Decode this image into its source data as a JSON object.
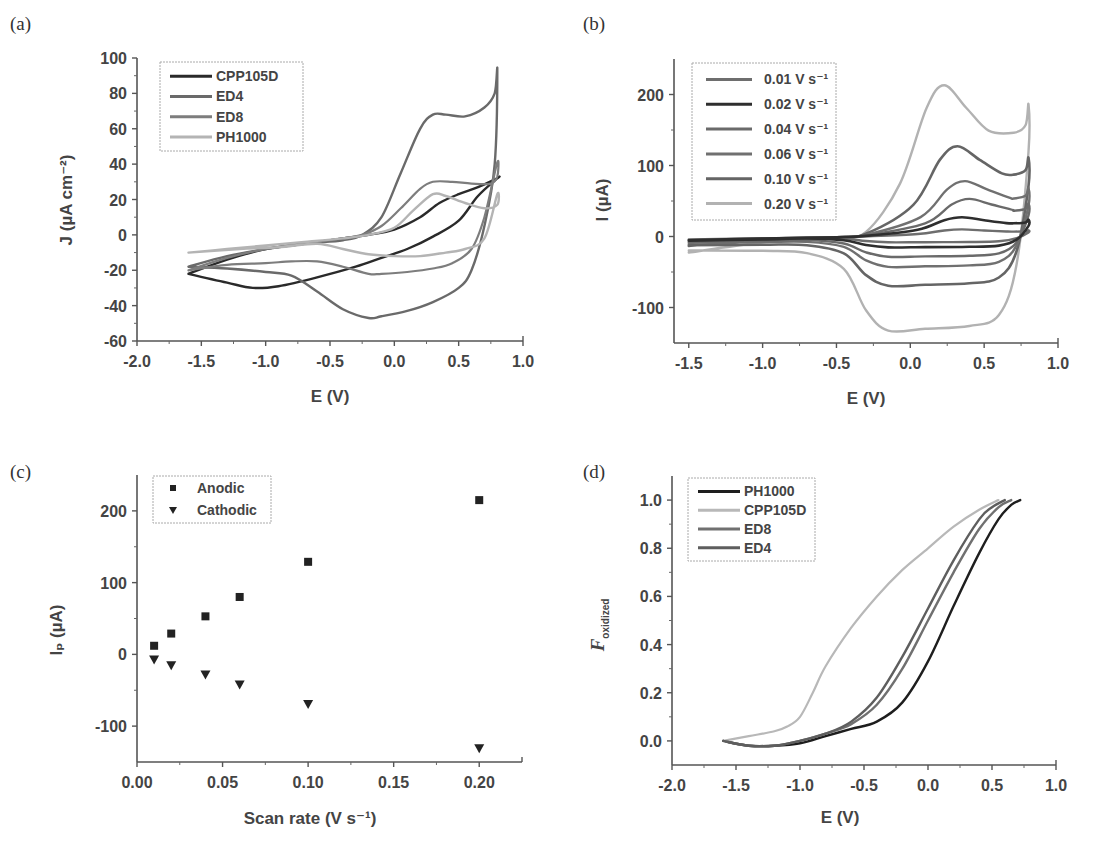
{
  "chart_data": [
    {
      "id": "a",
      "panel_label": "(a)",
      "type": "line",
      "title": "",
      "xlabel": "E (V)",
      "ylabel": "J (µA cm⁻²)",
      "xlim": [
        -2.0,
        1.0
      ],
      "ylim": [
        -60,
        100
      ],
      "xticks": [
        -2.0,
        -1.5,
        -1.0,
        -0.5,
        0.0,
        0.5,
        1.0
      ],
      "xtick_labels": [
        "-2.0",
        "-1.5",
        "-1.0",
        "-0.5",
        "0.0",
        "0.5",
        "1.0"
      ],
      "yticks": [
        -60,
        -40,
        -20,
        0,
        20,
        40,
        60,
        80,
        100
      ],
      "ytick_labels": [
        "-60",
        "-40",
        "-20",
        "0",
        "20",
        "40",
        "60",
        "80",
        "100"
      ],
      "grid": false,
      "legend_position": "upper-left",
      "series": [
        {
          "name": "CPP105D",
          "color": "#2a2a2a",
          "width": 2.4,
          "x": [
            -1.6,
            -1.3,
            -1.0,
            -0.7,
            -0.4,
            -0.2,
            0.0,
            0.2,
            0.35,
            0.5,
            0.65,
            0.8,
            0.8,
            0.65,
            0.5,
            0.3,
            0.1,
            -0.1,
            -0.3,
            -0.6,
            -0.9,
            -1.1,
            -1.3,
            -1.6
          ],
          "y": [
            -22,
            -14,
            -8,
            -5,
            -2,
            0,
            3,
            10,
            18,
            23,
            27,
            32,
            32,
            22,
            8,
            -1,
            -8,
            -13,
            -18,
            -24,
            -29,
            -30,
            -27,
            -22
          ]
        },
        {
          "name": "ED4",
          "color": "#6a6a6a",
          "width": 2.4,
          "x": [
            -1.6,
            -1.3,
            -1.0,
            -0.7,
            -0.4,
            -0.25,
            -0.1,
            0.05,
            0.2,
            0.3,
            0.4,
            0.55,
            0.7,
            0.78,
            0.8,
            0.78,
            0.7,
            0.6,
            0.5,
            0.3,
            0.1,
            -0.1,
            -0.2,
            -0.4,
            -0.6,
            -0.8,
            -1.0,
            -1.3,
            -1.6
          ],
          "y": [
            -18,
            -12,
            -8,
            -5,
            -3,
            0,
            10,
            35,
            60,
            68,
            68,
            67,
            72,
            80,
            93,
            40,
            5,
            -20,
            -30,
            -38,
            -43,
            -46,
            -47,
            -42,
            -32,
            -23,
            -21,
            -19,
            -18
          ]
        },
        {
          "name": "ED8",
          "color": "#7d7d7d",
          "width": 2.2,
          "x": [
            -1.6,
            -1.3,
            -1.0,
            -0.7,
            -0.4,
            -0.25,
            -0.1,
            0.05,
            0.2,
            0.3,
            0.45,
            0.6,
            0.75,
            0.8,
            0.8,
            0.7,
            0.6,
            0.45,
            0.3,
            0.1,
            -0.1,
            -0.2,
            -0.4,
            -0.6,
            -0.8,
            -1.0,
            -1.3,
            -1.6
          ],
          "y": [
            -20,
            -13,
            -8,
            -5,
            -2,
            0,
            5,
            15,
            26,
            30,
            30,
            29,
            29,
            33,
            41,
            10,
            -8,
            -16,
            -19,
            -21,
            -22,
            -22,
            -18,
            -15,
            -15,
            -16,
            -17,
            -20
          ]
        },
        {
          "name": "PH1000",
          "color": "#b4b4b4",
          "width": 2.4,
          "x": [
            -1.6,
            -1.3,
            -1.0,
            -0.7,
            -0.4,
            -0.2,
            0.0,
            0.15,
            0.3,
            0.4,
            0.55,
            0.7,
            0.8,
            0.8,
            0.7,
            0.55,
            0.4,
            0.2,
            0.0,
            -0.2,
            -0.4,
            -0.6,
            -0.9,
            -1.2,
            -1.6
          ],
          "y": [
            -10,
            -8,
            -6,
            -4,
            -2,
            0,
            4,
            14,
            23,
            22,
            18,
            15,
            17,
            23,
            -2,
            -8,
            -10,
            -12,
            -12,
            -11,
            -8,
            -5,
            -7,
            -8,
            -10
          ]
        }
      ]
    },
    {
      "id": "b",
      "panel_label": "(b)",
      "type": "line",
      "title": "",
      "xlabel": "E (V)",
      "ylabel": "I (µA)",
      "xlim": [
        -1.6,
        1.0
      ],
      "ylim": [
        -150,
        250
      ],
      "xticks": [
        -1.5,
        -1.0,
        -0.5,
        0.0,
        0.5,
        1.0
      ],
      "xtick_labels": [
        "-1.5",
        "-1.0",
        "-0.5",
        "0.0",
        "0.5",
        "1.0"
      ],
      "yticks": [
        -100,
        0,
        100,
        200
      ],
      "ytick_labels": [
        "-100",
        "0",
        "100",
        "200"
      ],
      "grid": false,
      "legend_position": "upper-left",
      "series": [
        {
          "name": "0.01 V s⁻¹",
          "color": "#6e6e6e",
          "width": 2.4,
          "anodic_peak": 10,
          "cathodic_level": -8,
          "peak_E": 0.35
        },
        {
          "name": "0.02 V s⁻¹",
          "color": "#2e2e2e",
          "width": 2.6,
          "anodic_peak": 27,
          "cathodic_level": -15,
          "peak_E": 0.35
        },
        {
          "name": "0.04 V s⁻¹",
          "color": "#6a6a6a",
          "width": 2.4,
          "anodic_peak": 53,
          "cathodic_level": -28,
          "peak_E": 0.4
        },
        {
          "name": "0.06 V s⁻¹",
          "color": "#707070",
          "width": 2.4,
          "anodic_peak": 78,
          "cathodic_level": -42,
          "peak_E": 0.37
        },
        {
          "name": "0.10 V s⁻¹",
          "color": "#656565",
          "width": 2.6,
          "anodic_peak": 127,
          "cathodic_level": -68,
          "peak_E": 0.32
        },
        {
          "name": "0.20 V s⁻¹",
          "color": "#b2b2b2",
          "width": 2.4,
          "anodic_peak": 213,
          "cathodic_level": -130,
          "peak_E": 0.23
        }
      ]
    },
    {
      "id": "c",
      "panel_label": "(c)",
      "type": "scatter",
      "title": "",
      "xlabel": "Scan rate (V s⁻¹)",
      "ylabel": "Iₚ (µA)",
      "xlim": [
        0.0,
        0.225
      ],
      "ylim": [
        -150,
        250
      ],
      "xticks": [
        0.0,
        0.05,
        0.1,
        0.15,
        0.2
      ],
      "xtick_labels": [
        "0.00",
        "0.05",
        "0.10",
        "0.15",
        "0.20"
      ],
      "yticks": [
        -100,
        0,
        100,
        200
      ],
      "ytick_labels": [
        "-100",
        "0",
        "100",
        "200"
      ],
      "grid": false,
      "legend_position": "upper-left",
      "x": [
        0.01,
        0.02,
        0.04,
        0.06,
        0.1,
        0.2
      ],
      "series": [
        {
          "name": "Anodic",
          "marker": "square",
          "color": "#222222",
          "values": [
            12,
            29,
            53,
            80,
            129,
            215
          ]
        },
        {
          "name": "Cathodic",
          "marker": "triangle-down",
          "color": "#222222",
          "values": [
            -7,
            -15,
            -28,
            -42,
            -69,
            -131
          ]
        }
      ]
    },
    {
      "id": "d",
      "panel_label": "(d)",
      "type": "line",
      "title": "",
      "xlabel": "E (V)",
      "ylabel": "F_oxidized",
      "ylabel_main": "F",
      "ylabel_sub": "oxidized",
      "xlim": [
        -2.0,
        1.0
      ],
      "ylim": [
        -0.1,
        1.1
      ],
      "xticks": [
        -2.0,
        -1.5,
        -1.0,
        -0.5,
        0.0,
        0.5,
        1.0
      ],
      "xtick_labels": [
        "-2.0",
        "-1.5",
        "-1.0",
        "-0.5",
        "0.0",
        "0.5",
        "1.0"
      ],
      "yticks": [
        0.0,
        0.2,
        0.4,
        0.6,
        0.8,
        1.0
      ],
      "ytick_labels": [
        "0.0",
        "0.2",
        "0.4",
        "0.6",
        "0.8",
        "1.0"
      ],
      "grid": false,
      "legend_position": "upper-left",
      "series": [
        {
          "name": "PH1000",
          "color": "#1e1e1e",
          "width": 2.4,
          "x": [
            -1.6,
            -1.4,
            -1.2,
            -1.0,
            -0.8,
            -0.6,
            -0.4,
            -0.2,
            0.0,
            0.2,
            0.4,
            0.55,
            0.65,
            0.72
          ],
          "y": [
            0.0,
            -0.02,
            -0.02,
            -0.01,
            0.02,
            0.05,
            0.08,
            0.16,
            0.33,
            0.56,
            0.78,
            0.92,
            0.98,
            1.0
          ]
        },
        {
          "name": "CPP105D",
          "color": "#b8b8b8",
          "width": 2.2,
          "x": [
            -1.6,
            -1.4,
            -1.2,
            -1.1,
            -1.0,
            -0.9,
            -0.8,
            -0.6,
            -0.4,
            -0.2,
            0.0,
            0.2,
            0.4,
            0.55
          ],
          "y": [
            0.0,
            0.02,
            0.04,
            0.06,
            0.1,
            0.2,
            0.31,
            0.47,
            0.6,
            0.71,
            0.8,
            0.89,
            0.96,
            1.0
          ]
        },
        {
          "name": "ED8",
          "color": "#707070",
          "width": 2.4,
          "x": [
            -1.6,
            -1.4,
            -1.2,
            -1.0,
            -0.8,
            -0.6,
            -0.4,
            -0.2,
            0.0,
            0.2,
            0.4,
            0.55,
            0.65
          ],
          "y": [
            0.0,
            -0.02,
            -0.02,
            0.0,
            0.03,
            0.07,
            0.15,
            0.3,
            0.5,
            0.7,
            0.88,
            0.97,
            1.0
          ]
        },
        {
          "name": "ED4",
          "color": "#5e5e5e",
          "width": 2.4,
          "x": [
            -1.6,
            -1.4,
            -1.2,
            -1.0,
            -0.8,
            -0.6,
            -0.4,
            -0.2,
            0.0,
            0.2,
            0.4,
            0.5,
            0.6
          ],
          "y": [
            0.0,
            -0.02,
            -0.02,
            0.0,
            0.03,
            0.08,
            0.18,
            0.35,
            0.55,
            0.75,
            0.92,
            0.97,
            1.0
          ]
        }
      ]
    }
  ],
  "layout": {
    "panels": {
      "a": {
        "x0": 137,
        "x1": 523,
        "y0": 341,
        "y1": 58,
        "label_x": 10,
        "label_y": 30,
        "legend": {
          "x": 160,
          "y": 62,
          "w": 143,
          "h": 89
        }
      },
      "b": {
        "x0": 674,
        "x1": 1058,
        "y0": 343,
        "y1": 59,
        "label_x": 583,
        "label_y": 30,
        "legend": {
          "x": 692,
          "y": 63,
          "w": 144,
          "h": 157
        }
      },
      "c": {
        "x0": 137,
        "x1": 522,
        "y0": 762,
        "y1": 475,
        "label_x": 10,
        "label_y": 478,
        "legend": {
          "x": 153,
          "y": 476,
          "w": 118,
          "h": 47
        }
      },
      "d": {
        "x0": 672,
        "x1": 1056,
        "y0": 765,
        "y1": 476,
        "label_x": 583,
        "label_y": 478,
        "legend": {
          "x": 688,
          "y": 478,
          "w": 127,
          "h": 83
        }
      }
    }
  }
}
